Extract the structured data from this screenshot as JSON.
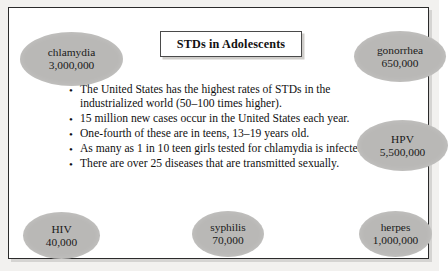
{
  "slide": {
    "title": "STDs in Adolescents",
    "bullets": [
      "The United States has the highest rates of STDs in the industrialized world (50–100 times higher).",
      "15 million new cases occur in the United States each year.",
      "One-fourth of these are in teens, 13–19 years old.",
      "As many as 1 in 10 teen girls tested for chlamydia is infected.",
      "There are over 25 diseases that are transmitted sexually."
    ],
    "bullet_marker": "•",
    "bubbles": [
      {
        "id": "chlamydia",
        "name": "chlamydia",
        "value": "3,000,000"
      },
      {
        "id": "gonorrhea",
        "name": "gonorrhea",
        "value": "650,000"
      },
      {
        "id": "hpv",
        "name": "HPV",
        "value": "5,500,000"
      },
      {
        "id": "hiv",
        "name": "HIV",
        "value": "40,000"
      },
      {
        "id": "syphilis",
        "name": "syphilis",
        "value": "70,000"
      },
      {
        "id": "herpes",
        "name": "herpes",
        "value": "1,000,000"
      }
    ],
    "colors": {
      "bubble_fill": "#b9b8b6",
      "frame_border": "#2b2b2b",
      "text": "#111111",
      "page_background": "#f2f1ef",
      "slide_background": "#ffffff"
    }
  }
}
